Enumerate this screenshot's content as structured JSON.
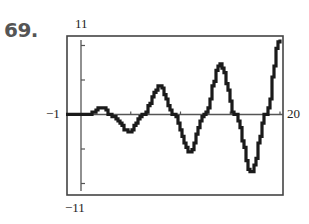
{
  "problem": {
    "number": "69."
  },
  "chart_data": {
    "type": "line",
    "title": "",
    "xlabel": "",
    "ylabel": "",
    "xlim": [
      -1,
      20
    ],
    "ylim": [
      -11,
      11
    ],
    "grid": false,
    "legend": null,
    "window_labels": {
      "ymax": "11",
      "ymin": "−11",
      "xmin": "−1",
      "xmax": "20"
    },
    "x_ticks": [
      5,
      10,
      15,
      20
    ],
    "y_ticks": [
      -10,
      -5,
      5,
      10
    ],
    "series": [
      {
        "name": "f(x)",
        "style": "thick stair-stepped calculator trace",
        "points": [
          [
            -1.5,
            0.0
          ],
          [
            0.0,
            0.0
          ],
          [
            0.8,
            0.05
          ],
          [
            1.2,
            0.4
          ],
          [
            1.8,
            0.94
          ],
          [
            2.4,
            0.9
          ],
          [
            2.8,
            0.0
          ],
          [
            4.9,
            -2.4
          ],
          [
            6.2,
            0.0
          ],
          [
            7.9,
            4.1
          ],
          [
            9.3,
            0.0
          ],
          [
            10.9,
            -5.4
          ],
          [
            12.4,
            0.0
          ],
          [
            14.0,
            7.3
          ],
          [
            15.5,
            0.0
          ],
          [
            17.1,
            -8.4
          ],
          [
            18.6,
            0.0
          ],
          [
            19.9,
            10.7
          ]
        ]
      }
    ]
  },
  "colors": {
    "ink": "#1a1a1a",
    "frame": "#444444",
    "number": "#555555"
  }
}
